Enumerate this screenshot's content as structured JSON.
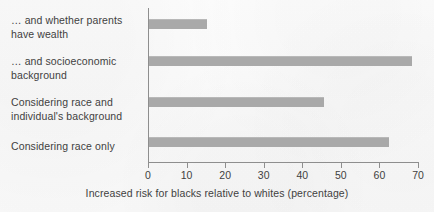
{
  "chart_data": {
    "type": "bar",
    "orientation": "horizontal",
    "title": "",
    "subtitle": "",
    "xlabel": "Increased risk for blacks relative to whites (percentage)",
    "ylabel": "",
    "categories": [
      "Considering race only",
      "Considering race and individual's background",
      "… and socioeconomic background",
      "… and whether parents have wealth"
    ],
    "category_lines": [
      [
        "Considering race only"
      ],
      [
        "Considering race and",
        "individual's background"
      ],
      [
        "… and socioeconomic",
        "background"
      ],
      [
        "… and whether parents",
        "have wealth"
      ]
    ],
    "values": [
      62.5,
      45.5,
      68.5,
      15.3
    ],
    "xlim": [
      0,
      70
    ],
    "xticks": [
      0,
      10,
      20,
      30,
      40,
      50,
      60,
      70
    ],
    "xtick_labels": [
      "0",
      "10",
      "20",
      "30",
      "40",
      "50",
      "60",
      "70"
    ],
    "grid": false,
    "legend": null,
    "bar_color": "#a9a9a9",
    "axis_color": "#8e8e8e",
    "text_color": "#3f3f3f",
    "background_color": "#fbfbfb"
  }
}
